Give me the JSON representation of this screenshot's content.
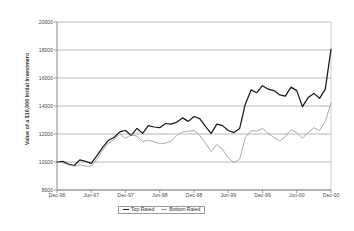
{
  "chart_data": {
    "type": "line",
    "title": "",
    "xlabel": "",
    "ylabel": "Value of a $10,000 Initial Investment",
    "ylim": [
      8000,
      20000
    ],
    "yticks": [
      8000,
      10000,
      12000,
      14000,
      16000,
      18000,
      20000
    ],
    "ytick_labels": [
      "8000",
      "10000",
      "12000",
      "14000",
      "16000",
      "18000",
      "20000"
    ],
    "grid": true,
    "grid_axis": "y",
    "legend_position": "bottom-center",
    "x": [
      "Dec-96",
      "Jan-97",
      "Feb-97",
      "Mar-97",
      "Apr-97",
      "May-97",
      "Jun-97",
      "Jul-97",
      "Aug-97",
      "Sep-97",
      "Oct-97",
      "Nov-97",
      "Dec-97",
      "Jan-98",
      "Feb-98",
      "Mar-98",
      "Apr-98",
      "May-98",
      "Jun-98",
      "Jul-98",
      "Aug-98",
      "Sep-98",
      "Oct-98",
      "Nov-98",
      "Dec-98",
      "Jan-99",
      "Feb-99",
      "Mar-99",
      "Apr-99",
      "May-99",
      "Jun-99",
      "Jul-99",
      "Aug-99",
      "Sep-99",
      "Oct-99",
      "Nov-99",
      "Dec-99",
      "Jan-00",
      "Feb-00",
      "Mar-00",
      "Apr-00",
      "May-00",
      "Jun-00",
      "Jul-00",
      "Aug-00",
      "Sep-00",
      "Oct-00",
      "Nov-00",
      "Dec-00"
    ],
    "xtick_labels": [
      "Dec-96",
      "Jun-97",
      "Dec-97",
      "Jun-98",
      "Dec-98",
      "Jun-99",
      "Dec-99",
      "Jun-00",
      "Dec-00"
    ],
    "xtick_indices": [
      0,
      6,
      12,
      18,
      24,
      30,
      36,
      42,
      48
    ],
    "series": [
      {
        "name": "Top Rated",
        "color": "#1a1a1a",
        "values": [
          10000,
          10050,
          9850,
          9750,
          10150,
          10050,
          9900,
          10450,
          11050,
          11550,
          11750,
          12150,
          12250,
          11900,
          12400,
          12050,
          12600,
          12500,
          12450,
          12750,
          12700,
          12850,
          13150,
          12900,
          13250,
          13100,
          12550,
          12050,
          12700,
          12600,
          12250,
          12100,
          12400,
          14150,
          15150,
          14950,
          15450,
          15200,
          15100,
          14800,
          14700,
          15350,
          15100,
          13950,
          14600,
          14900,
          14550,
          15200,
          18050
        ]
      },
      {
        "name": "Bottom Rated",
        "color": "#9b9b9b",
        "values": [
          10000,
          9950,
          9800,
          9700,
          9800,
          9700,
          9700,
          10200,
          10850,
          11350,
          11600,
          12000,
          11700,
          11950,
          11850,
          11450,
          11550,
          11450,
          11300,
          11350,
          11500,
          11900,
          12150,
          12200,
          12250,
          11900,
          11350,
          10750,
          11250,
          10900,
          10300,
          9950,
          10200,
          11750,
          12250,
          12200,
          12400,
          12050,
          11750,
          11500,
          11800,
          12300,
          12100,
          11700,
          12100,
          12450,
          12250,
          12900,
          14200
        ]
      }
    ]
  },
  "legend": {
    "items": [
      {
        "label": "Top Rated",
        "color": "#1a1a1a"
      },
      {
        "label": "Bottom Rated",
        "color": "#9b9b9b"
      }
    ]
  }
}
